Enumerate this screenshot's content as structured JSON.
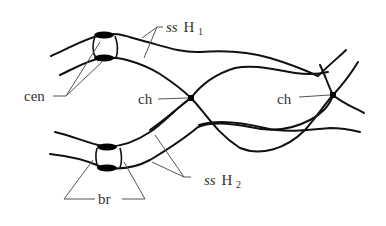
{
  "diagram": {
    "type": "chromosome-pairing",
    "labels": {
      "ss_h1": {
        "prefix": "ss",
        "main": "H",
        "sub": "1"
      },
      "ss_h2": {
        "prefix": "ss",
        "main": "H",
        "sub": "2"
      },
      "cen": "cen",
      "ch_left": "ch",
      "ch_right": "ch",
      "br": "br"
    },
    "colors": {
      "line": "#111111",
      "label": "#333333",
      "leader": "#555555"
    }
  }
}
